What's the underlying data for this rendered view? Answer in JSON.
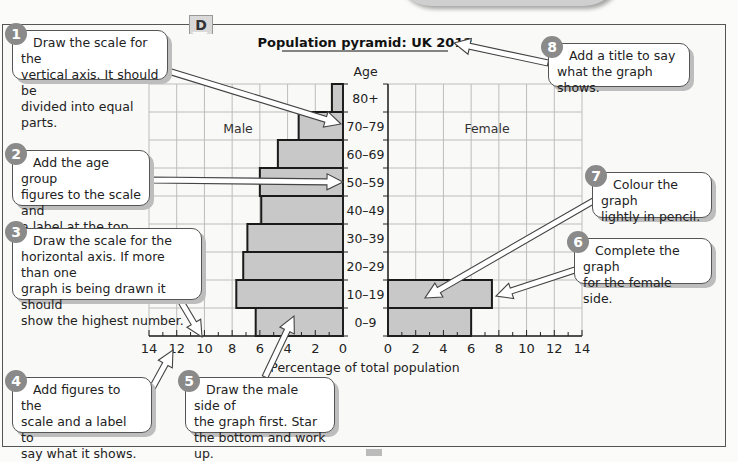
{
  "page": {
    "section_tab": "D",
    "background": "#f9f9f7"
  },
  "chart_data": {
    "type": "bar",
    "subtype": "population-pyramid",
    "title": "Population pyramid: UK 2012",
    "y_axis_label": "Age",
    "xlabel": "Percentage of total population",
    "side_labels": {
      "left": "Male",
      "right": "Female"
    },
    "categories": [
      "80+",
      "70–79",
      "60–69",
      "50–59",
      "40–49",
      "30–39",
      "20–29",
      "10–19",
      "0–9"
    ],
    "series": [
      {
        "name": "Male",
        "side": "left",
        "values": [
          0.8,
          3.2,
          4.7,
          6.0,
          5.9,
          6.9,
          7.2,
          7.7,
          6.3
        ]
      },
      {
        "name": "Female",
        "side": "right",
        "values": [
          null,
          null,
          null,
          null,
          null,
          null,
          null,
          7.5,
          6.0
        ]
      }
    ],
    "x_ticks_left": [
      "14",
      "12",
      "10",
      "8",
      "6",
      "4",
      "2",
      "0"
    ],
    "x_ticks_right": [
      "0",
      "2",
      "4",
      "6",
      "8",
      "10",
      "12",
      "14"
    ],
    "xlim": [
      0,
      14
    ],
    "grid": true,
    "colors": {
      "bar_fill": "#c8c8c8",
      "bar_stroke": "#1a1a1a",
      "grid": "#bdbdbd"
    }
  },
  "callouts": [
    {
      "number": "1",
      "text": "Draw the scale for the\nvertical axis. It should be\ndivided into equal parts."
    },
    {
      "number": "2",
      "text": "Add the age group\nfigures to the scale and\na label at the top."
    },
    {
      "number": "3",
      "text": "Draw the scale for the\nhorizontal axis. If more than one\ngraph is being drawn it should\nshow the highest number."
    },
    {
      "number": "4",
      "text": "Add figures to the\nscale and a label to\nsay what it shows."
    },
    {
      "number": "5",
      "text": "Draw the male side of\nthe graph first. Star\nthe bottom and work up."
    },
    {
      "number": "6",
      "text": "Complete the graph\nfor the female side."
    },
    {
      "number": "7",
      "text": "Colour the graph\nlightly in pencil."
    },
    {
      "number": "8",
      "text": "Add a title to say\nwhat the graph shows."
    }
  ]
}
